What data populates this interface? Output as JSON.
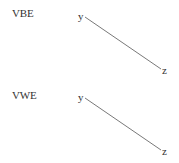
{
  "diagrams": [
    {
      "label": "VBE",
      "nodes": [
        {
          "id": "y",
          "text": "y"
        },
        {
          "id": "z",
          "text": "z"
        }
      ],
      "edges": [
        {
          "from": "y",
          "to": "z"
        }
      ]
    },
    {
      "label": "VWE",
      "nodes": [
        {
          "id": "y",
          "text": "y"
        },
        {
          "id": "z",
          "text": "z"
        }
      ],
      "edges": [
        {
          "from": "y",
          "to": "z"
        }
      ]
    }
  ],
  "colors": {
    "text": "#333333",
    "edge": "#555555",
    "background": "#ffffff"
  }
}
